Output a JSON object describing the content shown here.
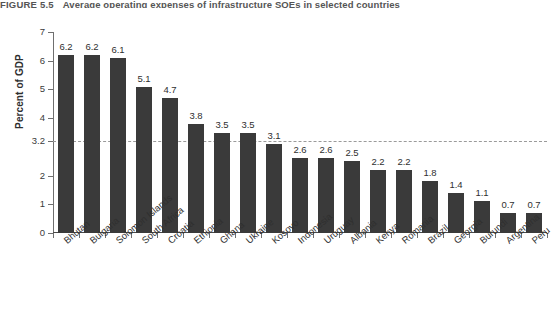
{
  "figure": {
    "number": "FIGURE 5.5",
    "title": "Average operating expenses of infrastructure SOEs in selected countries"
  },
  "chart_data": {
    "type": "bar",
    "title": "Average operating expenses of infrastructure SOEs in selected countries",
    "xlabel": "",
    "ylabel": "Percent of GDP",
    "ylim": [
      0,
      7
    ],
    "grid": false,
    "legend": null,
    "categories": [
      "Bhutan",
      "Bulgaria",
      "Solomon Islands",
      "South Africa",
      "Croatia",
      "Ethiopia",
      "Ghana",
      "Ukraine",
      "Kosovo",
      "Indonesia",
      "Uruguay",
      "Albania",
      "Kenya",
      "Romania",
      "Brazil",
      "Georgia",
      "Burundi",
      "Argentina",
      "Peru"
    ],
    "values": [
      6.2,
      6.2,
      6.1,
      5.1,
      4.7,
      3.8,
      3.5,
      3.5,
      3.1,
      2.6,
      2.6,
      2.5,
      2.2,
      2.2,
      1.8,
      1.4,
      1.1,
      0.7,
      0.7
    ],
    "value_labels": [
      "6.2",
      "6.2",
      "6.1",
      "5.1",
      "4.7",
      "3.8",
      "3.5",
      "3.5",
      "3.1",
      "2.6",
      "2.6",
      "2.5",
      "2.2",
      "2.2",
      "1.8",
      "1.4",
      "1.1",
      "0.7",
      "0.7"
    ],
    "y_ticks": [
      0,
      1,
      2,
      3.2,
      4,
      5,
      6,
      7
    ],
    "y_tick_labels": [
      "0",
      "1",
      "2",
      "3.2",
      "4",
      "5",
      "6",
      "7"
    ],
    "reference_line": {
      "value": 3.2,
      "label": "3.2",
      "style": "dashed",
      "color": "#9a9a9a"
    },
    "bar_color": "#3a3a3a",
    "axis_color": "#6f6f6f",
    "background_color": "#ffffff"
  }
}
